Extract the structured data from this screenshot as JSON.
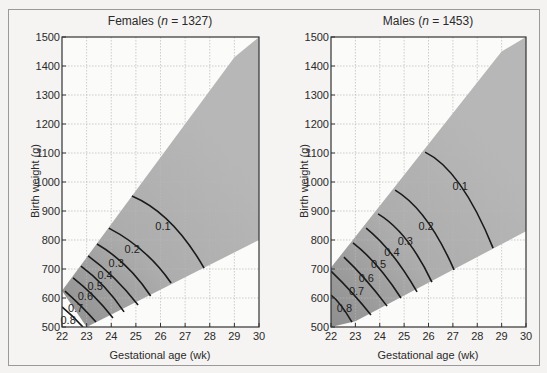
{
  "chart_data": [
    {
      "type": "contour",
      "title": "Females (n = 1327)",
      "title_prefix": "Females (",
      "title_italic": "n",
      "title_suffix": " = 1327)",
      "xlabel": "Gestational age (wk)",
      "ylabel": "Birth weight (g)",
      "xlim": [
        22,
        30
      ],
      "ylim": [
        500,
        1500
      ],
      "xticks": [
        22,
        23,
        24,
        25,
        26,
        27,
        28,
        29,
        30
      ],
      "yticks": [
        500,
        600,
        700,
        800,
        900,
        1000,
        1100,
        1200,
        1300,
        1400,
        1500
      ],
      "grid": true,
      "shaded_region": {
        "upper": [
          [
            22,
            625
          ],
          [
            29,
            1430
          ],
          [
            30,
            1500
          ]
        ],
        "lower": [
          [
            23,
            500
          ],
          [
            30,
            800
          ]
        ]
      },
      "contours": [
        {
          "level": "0.1",
          "points": [
            [
              24.84,
              952
            ],
            [
              26.4,
              860
            ],
            [
              27.77,
              703
            ]
          ],
          "label_at": [
            26.1,
            850
          ]
        },
        {
          "level": "0.2",
          "points": [
            [
              23.9,
              841
            ],
            [
              25.3,
              760
            ],
            [
              26.43,
              652
            ]
          ],
          "label_at": [
            24.85,
            768
          ]
        },
        {
          "level": "0.3",
          "points": [
            [
              23.42,
              786
            ],
            [
              24.6,
              710
            ],
            [
              25.6,
              607
            ]
          ],
          "label_at": [
            24.2,
            722
          ]
        },
        {
          "level": "0.4",
          "points": [
            [
              23.06,
              745
            ],
            [
              24.1,
              670
            ],
            [
              25.09,
              576
            ]
          ],
          "label_at": [
            23.75,
            680
          ]
        },
        {
          "level": "0.5",
          "points": [
            [
              22.77,
              710
            ],
            [
              23.7,
              640
            ],
            [
              24.52,
              552
            ]
          ],
          "label_at": [
            23.35,
            642
          ]
        },
        {
          "level": "0.6",
          "points": [
            [
              22.45,
              669
            ],
            [
              23.3,
              605
            ],
            [
              24.07,
              531
            ]
          ],
          "label_at": [
            22.95,
            607
          ]
        },
        {
          "level": "0.7",
          "points": [
            [
              22.12,
              624
            ],
            [
              22.8,
              570
            ],
            [
              23.38,
              517
            ]
          ],
          "label_at": [
            22.55,
            565
          ]
        },
        {
          "level": "0.8",
          "points": [
            [
              22.0,
              569
            ],
            [
              22.45,
              535
            ],
            [
              22.85,
              500
            ]
          ],
          "label_at": [
            22.25,
            525
          ]
        }
      ]
    },
    {
      "type": "contour",
      "title": "Males (n = 1453)",
      "title_prefix": "Males (",
      "title_italic": "n",
      "title_suffix": " = 1453)",
      "xlabel": "Gestational age (wk)",
      "ylabel": "Birth weight (g)",
      "xlim": [
        22,
        30
      ],
      "ylim": [
        500,
        1500
      ],
      "xticks": [
        22,
        23,
        24,
        25,
        26,
        27,
        28,
        29,
        30
      ],
      "yticks": [
        500,
        600,
        700,
        800,
        900,
        1000,
        1100,
        1200,
        1300,
        1400,
        1500
      ],
      "grid": true,
      "shaded_region": {
        "upper": [
          [
            22,
            705
          ],
          [
            29,
            1450
          ],
          [
            30,
            1500
          ]
        ],
        "lower": [
          [
            22,
            500
          ],
          [
            23,
            520
          ],
          [
            30,
            830
          ]
        ]
      },
      "contours": [
        {
          "level": "0.1",
          "points": [
            [
              25.86,
              1103
            ],
            [
              27.3,
              990
            ],
            [
              28.65,
              772
            ]
          ],
          "label_at": [
            27.3,
            985
          ]
        },
        {
          "level": "0.2",
          "points": [
            [
              24.63,
              972
            ],
            [
              25.9,
              870
            ],
            [
              27.05,
              697
            ]
          ],
          "label_at": [
            25.9,
            850
          ]
        },
        {
          "level": "0.3",
          "points": [
            [
              23.93,
              890
            ],
            [
              25.1,
              800
            ],
            [
              26.14,
              655
            ]
          ],
          "label_at": [
            25.05,
            798
          ]
        },
        {
          "level": "0.4",
          "points": [
            [
              23.44,
              841
            ],
            [
              24.5,
              750
            ],
            [
              25.53,
              621
            ]
          ],
          "label_at": [
            24.5,
            757
          ]
        },
        {
          "level": "0.5",
          "points": [
            [
              22.9,
              790
            ],
            [
              23.9,
              710
            ],
            [
              24.87,
              600
            ]
          ],
          "label_at": [
            23.95,
            718
          ]
        },
        {
          "level": "0.6",
          "points": [
            [
              22.53,
              741
            ],
            [
              23.4,
              665
            ],
            [
              24.3,
              572
            ]
          ],
          "label_at": [
            23.45,
            670
          ]
        },
        {
          "level": "0.7",
          "points": [
            [
              22.0,
              693
            ],
            [
              22.9,
              615
            ],
            [
              23.64,
              541
            ]
          ],
          "label_at": [
            23.05,
            625
          ]
        },
        {
          "level": "0.8",
          "points": [
            [
              22.0,
              610
            ],
            [
              22.4,
              575
            ],
            [
              22.86,
              517
            ]
          ],
          "label_at": [
            22.55,
            567
          ]
        }
      ]
    }
  ]
}
